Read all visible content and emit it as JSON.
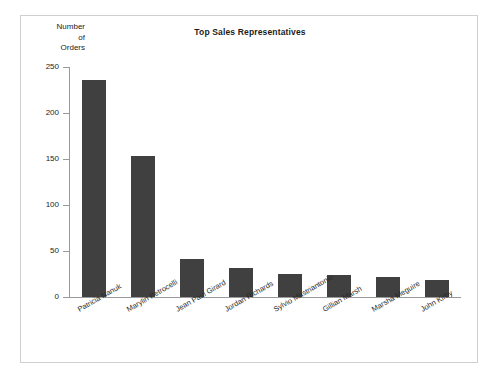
{
  "chart_data": {
    "type": "bar",
    "title": "Top Sales Representatives",
    "xlabel": "",
    "ylabel": "Number of Orders",
    "ylabel_lines": [
      "Number",
      "of",
      "Orders"
    ],
    "ylim": [
      0,
      250
    ],
    "yticks": [
      0,
      50,
      100,
      150,
      200,
      250
    ],
    "ytick_labels": [
      "0",
      "50",
      "100",
      "150",
      "200",
      "250"
    ],
    "grid": false,
    "legend": false,
    "bar_color": "#404040",
    "categories": [
      "Patricia Nanuk",
      "Marylin Petrocelli",
      "Jean Paul Girard",
      "Jordan Richards",
      "Sylvio Mastriantonio",
      "Gillian Marsh",
      "Marsha Meguire",
      "John Kirby"
    ],
    "values": [
      236,
      153,
      41,
      31,
      25,
      24,
      22,
      18
    ]
  }
}
